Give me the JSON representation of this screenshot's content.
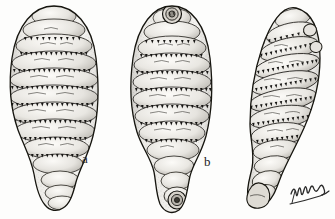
{
  "plate": {
    "kind": "scientific-engraving",
    "subject": "botfly larvae, three specimens",
    "background_color": "#fdfdfc",
    "ink_color": "#1b1b1b",
    "width_px": 335,
    "height_px": 219
  },
  "labels": {
    "specimen_a": "a",
    "specimen_b": "b"
  },
  "signature": {
    "text": "Hulss"
  },
  "specimens": [
    {
      "id": "a",
      "label": "a",
      "orientation": "dorsal view",
      "segments": 11,
      "center_x": 54,
      "top_y": 6,
      "bottom_y": 208,
      "max_width": 88
    },
    {
      "id": "b",
      "label": "b",
      "orientation": "ventral view with cephalic plate",
      "segments": 11,
      "center_x": 172,
      "top_y": 6,
      "bottom_y": 212,
      "max_width": 80
    },
    {
      "id": "c",
      "label": "",
      "orientation": "lateral oblique view",
      "segments": 11,
      "center_x": 288,
      "top_y": 8,
      "bottom_y": 210,
      "max_width": 76
    }
  ]
}
